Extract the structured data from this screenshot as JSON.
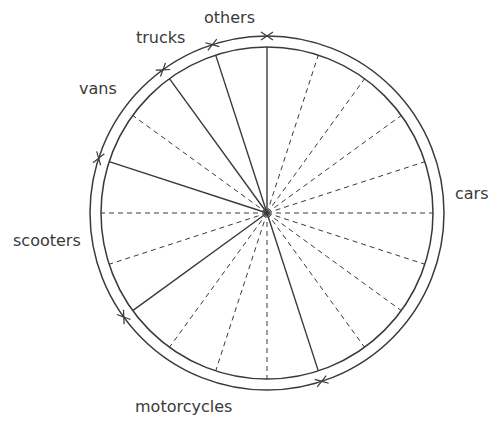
{
  "chart_data": {
    "type": "pie",
    "title": "",
    "style": "circle divided into 20 equal 5% sectors (dashed radii), category boundaries drawn as solid radii, arrow ticks on outer ring",
    "total_divisions": 20,
    "start_angle_deg": 0,
    "direction": "clockwise",
    "categories": [
      "cars",
      "motorcycles",
      "scooters",
      "vans",
      "trucks",
      "others"
    ],
    "values": [
      45,
      20,
      15,
      10,
      5,
      5
    ],
    "unit": "%",
    "legend": "none (labels placed outside circle)"
  },
  "geometry": {
    "cx": 267,
    "cy": 213,
    "r_inner": 166,
    "r_outer": 177
  },
  "colors": {
    "line": "#3a3a3a",
    "label": "#3a3a3a",
    "background": "#ffffff"
  },
  "labels": {
    "cars": "cars",
    "motorcycles": "motorcycles",
    "scooters": "scooters",
    "vans": "vans",
    "trucks": "trucks",
    "others": "others"
  }
}
